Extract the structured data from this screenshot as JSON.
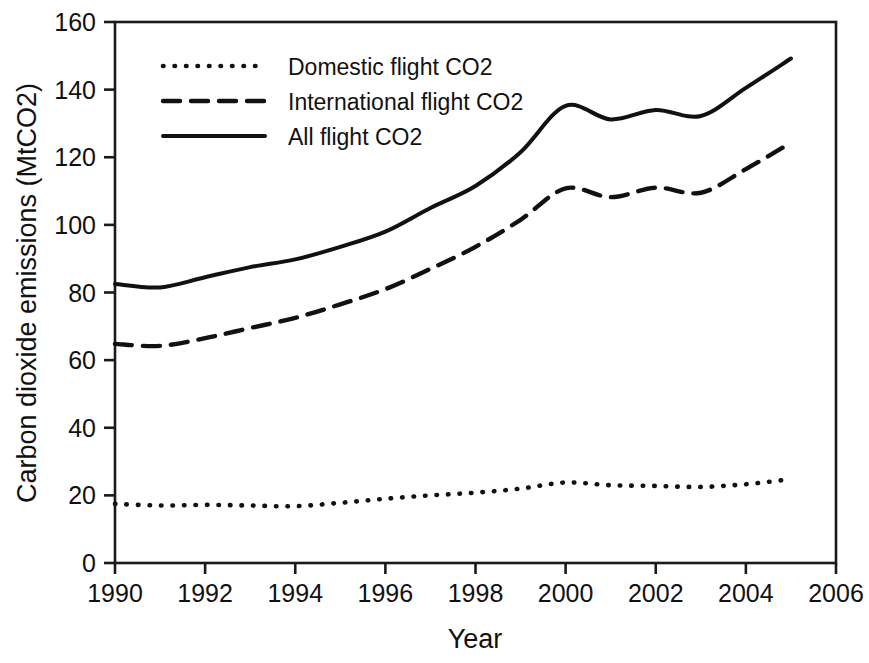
{
  "chart_data": {
    "type": "line",
    "title": "",
    "subtitle": "",
    "xlabel": "Year",
    "ylabel": "Carbon dioxide emissions (MtCO2)",
    "xlim": [
      1990,
      2006
    ],
    "ylim": [
      0,
      160
    ],
    "xticks": [
      1990,
      1992,
      1994,
      1996,
      1998,
      2000,
      2002,
      2004,
      2006
    ],
    "yticks": [
      0,
      20,
      40,
      60,
      80,
      100,
      120,
      140,
      160
    ],
    "xtick_labels": [
      "1990",
      "1992",
      "1994",
      "1996",
      "1998",
      "2000",
      "2002",
      "2004",
      "2006"
    ],
    "ytick_labels": [
      "0",
      "20",
      "40",
      "60",
      "80",
      "100",
      "120",
      "140",
      "160"
    ],
    "grid": false,
    "legend_position": "top-left",
    "x": [
      1990,
      1991,
      1992,
      1993,
      1994,
      1995,
      1996,
      1997,
      1998,
      1999,
      2000,
      2001,
      2002,
      2003,
      2004,
      2005
    ],
    "series": [
      {
        "name": "Domestic flight CO2",
        "style": "dotted",
        "color": "#111111",
        "values": [
          17.5,
          17.0,
          17.2,
          17.0,
          16.8,
          17.8,
          19.0,
          20.0,
          20.8,
          22.0,
          23.8,
          23.0,
          22.8,
          22.5,
          23.3,
          24.8
        ]
      },
      {
        "name": "International flight CO2",
        "style": "dashed",
        "color": "#111111",
        "values": [
          64.8,
          64.2,
          66.5,
          69.5,
          72.5,
          76.5,
          81.0,
          87.0,
          93.5,
          101.5,
          110.8,
          108.2,
          111.0,
          109.5,
          116.5,
          124.3
        ]
      },
      {
        "name": "All flight CO2",
        "style": "solid",
        "color": "#111111",
        "values": [
          82.5,
          81.5,
          84.5,
          87.5,
          89.8,
          93.5,
          98.0,
          105.0,
          111.5,
          121.5,
          135.2,
          131.2,
          134.0,
          132.2,
          140.5,
          149.2
        ]
      }
    ],
    "legend": [
      {
        "label": "Domestic flight CO2",
        "style": "dotted"
      },
      {
        "label": "International flight CO2",
        "style": "dashed"
      },
      {
        "label": "All flight CO2",
        "style": "solid"
      }
    ]
  }
}
